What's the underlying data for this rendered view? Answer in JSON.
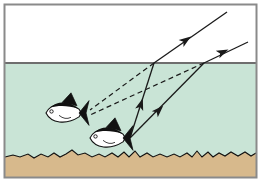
{
  "figure": {
    "width": 261,
    "height": 182
  },
  "colors": {
    "sky": "#ffffff",
    "water": "#c9e4d6",
    "sand": "#d7b98c",
    "frame": "#8a8a8a",
    "surface_line": "#6e6e6e",
    "ray": "#1a1a1a",
    "fish_body": "#ffffff",
    "fish_outline": "#111111",
    "fish_dark": "#111111",
    "seabed_line": "#111111"
  },
  "regions": {
    "frame": {
      "x": 4,
      "y": 4,
      "width": 253,
      "height": 174,
      "stroke_width": 2
    },
    "air": {
      "label": "air",
      "x": 5,
      "y": 5,
      "width": 251,
      "height": 58
    },
    "water": {
      "label": "water",
      "x": 5,
      "y": 63,
      "width": 251,
      "height": 109
    },
    "surface": {
      "label": "water-surface",
      "y": 63,
      "x1": 5,
      "x2": 256,
      "stroke_width": 2
    },
    "seabed": {
      "label": "sea-floor",
      "top_y": 154,
      "bottom_y": 177
    }
  },
  "fish": [
    {
      "name": "virtual-image-fish",
      "label": "apparent position of fish",
      "cx": 67,
      "cy": 113,
      "length": 42,
      "height": 13,
      "tail_x": 88,
      "eye_x": 52
    },
    {
      "name": "real-fish",
      "label": "actual position of fish",
      "cx": 111,
      "cy": 138,
      "length": 42,
      "height": 13,
      "tail_x": 132,
      "eye_x": 96
    }
  ],
  "rays": [
    {
      "name": "ray-1-underwater",
      "label": "incident ray 1 in water",
      "style": "solid",
      "from": {
        "x": 130,
        "y": 138
      },
      "to": {
        "x": 154,
        "y": 63
      },
      "arrow_at": {
        "x": 141,
        "y": 104
      },
      "direction": "up-right"
    },
    {
      "name": "ray-1-air",
      "label": "refracted ray 1 in air",
      "style": "solid",
      "from": {
        "x": 154,
        "y": 63
      },
      "to": {
        "x": 227,
        "y": 12
      },
      "arrow_at": {
        "x": 186,
        "y": 40
      },
      "direction": "up-right"
    },
    {
      "name": "ray-2-underwater",
      "label": "incident ray 2 in water",
      "style": "solid",
      "from": {
        "x": 130,
        "y": 138
      },
      "to": {
        "x": 204,
        "y": 63
      },
      "arrow_at": {
        "x": 159,
        "y": 110
      },
      "direction": "up-right"
    },
    {
      "name": "ray-2-air",
      "label": "refracted ray 2 in air",
      "style": "solid",
      "from": {
        "x": 204,
        "y": 63
      },
      "to": {
        "x": 248,
        "y": 42
      },
      "arrow_at": {
        "x": 223,
        "y": 52
      },
      "direction": "up-right"
    },
    {
      "name": "sightline-1",
      "label": "backward extension of ray 1 to apparent fish",
      "style": "dashed",
      "from": {
        "x": 154,
        "y": 63
      },
      "to": {
        "x": 90,
        "y": 110
      },
      "arrow_at": null,
      "direction": "down-left"
    },
    {
      "name": "sightline-2",
      "label": "backward extension of ray 2 to apparent fish",
      "style": "dashed",
      "from": {
        "x": 204,
        "y": 63
      },
      "to": {
        "x": 90,
        "y": 115
      },
      "arrow_at": null,
      "direction": "down-left"
    }
  ],
  "surface_points": [
    {
      "name": "refraction-point-1",
      "x": 154,
      "y": 63
    },
    {
      "name": "refraction-point-2",
      "x": 204,
      "y": 63
    }
  ],
  "seabed_profile": "5,157 13,155 20,157 28,154 34,158 41,154 48,157 54,153 60,157 66,154 72,150 78,155 85,153 92,157 99,154 105,157 112,153 118,157 124,152 129,157 135,151 140,157 147,153 153,157 160,154 167,157 174,154 180,157 187,153 192,157 197,151 202,157 208,152 213,157 219,153 225,156 231,152 238,156 245,152 251,156 256,153"
}
